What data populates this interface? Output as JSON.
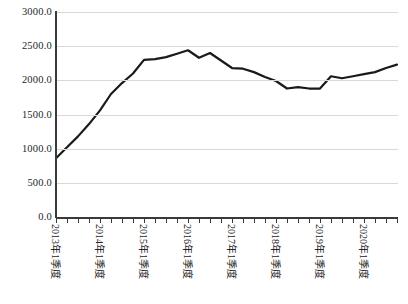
{
  "chart_data": {
    "type": "line",
    "title": "",
    "subtitle": "",
    "xlabel": "",
    "ylabel": "",
    "ylim": [
      0,
      3000
    ],
    "ytick_labels": [
      "3000.0",
      "2500.0",
      "2000.0",
      "1500.0",
      "1000.0",
      "500.0",
      "0.0"
    ],
    "ytick_values": [
      3000,
      2500,
      2000,
      1500,
      1000,
      500,
      0
    ],
    "grid": true,
    "legend": false,
    "legend_position": "none",
    "line_color": "#1a1a1a",
    "grid_color": "#d9d9d9",
    "axis_color": "#3a3a3a",
    "xtick_labels": [
      "2013年1季度",
      "2014年1季度",
      "2015年1季度",
      "2016年1季度",
      "2017年1季度",
      "2018年1季度",
      "2019年1季度",
      "2020年1季度"
    ],
    "categories": [
      "2013年1季度",
      "2013年2季度",
      "2013年3季度",
      "2013年4季度",
      "2014年1季度",
      "2014年2季度",
      "2014年3季度",
      "2014年4季度",
      "2015年1季度",
      "2015年2季度",
      "2015年3季度",
      "2015年4季度",
      "2016年1季度",
      "2016年2季度",
      "2016年3季度",
      "2016年4季度",
      "2017年1季度",
      "2017年2季度",
      "2017年3季度",
      "2017年4季度",
      "2018年1季度",
      "2018年2季度",
      "2018年3季度",
      "2018年4季度",
      "2019年1季度",
      "2019年2季度",
      "2019年3季度",
      "2019年4季度",
      "2020年1季度",
      "2020年2季度",
      "2020年3季度",
      "2020年4季度"
    ],
    "values": [
      860,
      1020,
      1180,
      1360,
      1560,
      1800,
      1960,
      2100,
      2300,
      2310,
      2340,
      2390,
      2440,
      2330,
      2400,
      2290,
      2180,
      2170,
      2120,
      2050,
      1990,
      1880,
      1900,
      1880,
      1880,
      2060,
      2030,
      2060,
      2090,
      2120,
      2180,
      2230
    ],
    "series": [
      {
        "name": "",
        "values": [
          860,
          1020,
          1180,
          1360,
          1560,
          1800,
          1960,
          2100,
          2300,
          2310,
          2340,
          2390,
          2440,
          2330,
          2400,
          2290,
          2180,
          2170,
          2120,
          2050,
          1990,
          1880,
          1900,
          1880,
          1880,
          2060,
          2030,
          2060,
          2090,
          2120,
          2180,
          2230
        ]
      }
    ]
  }
}
